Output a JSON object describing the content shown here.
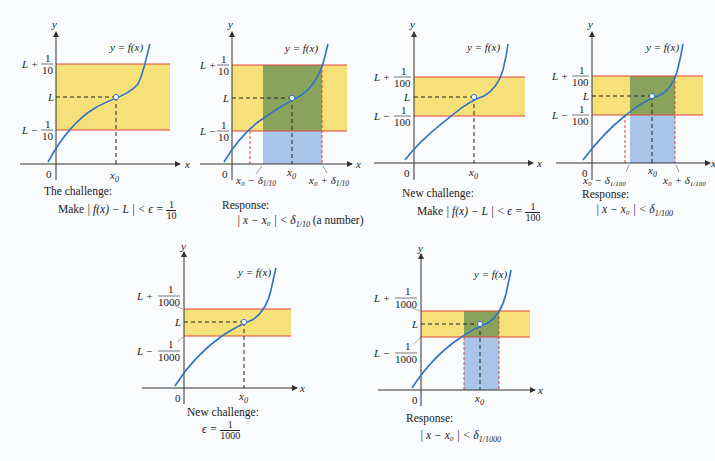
{
  "colors": {
    "band_yellow": "#f5e07a",
    "band_green": "#8aa35c",
    "strip_blue": "#a9c6ea",
    "boundary_red": "#e0443a",
    "curve_blue": "#2f73c2",
    "axis": "#333333"
  },
  "common": {
    "curve_label": "y = f(x)",
    "y_axis": "y",
    "x_axis": "x",
    "origin": "0",
    "x0": "x",
    "x0_sub": "0",
    "L": "L"
  },
  "panels": [
    {
      "id": "challenge-1-10",
      "upper": "L + 1/10",
      "upper_num": "1",
      "upper_den": "10",
      "lower_num": "1",
      "lower_den": "10",
      "caption_title": "The challenge:",
      "caption_expr_prefix": "Make",
      "caption_expr": "| f(x) − L | < ϵ = ",
      "caption_frac_num": "1",
      "caption_frac_den": "10"
    },
    {
      "id": "response-1-10",
      "upper_num": "1",
      "upper_den": "10",
      "lower_num": "1",
      "lower_den": "10",
      "left_tick": "x₀ − δ",
      "left_tick_sub": "1/10",
      "right_tick": "x₀ + δ",
      "right_tick_sub": "1/10",
      "caption_title": "Response:",
      "caption_expr": "| x − x₀ | < δ",
      "caption_sub": "1/10",
      "caption_suffix": " (a number)"
    },
    {
      "id": "challenge-1-100",
      "upper_num": "1",
      "upper_den": "100",
      "lower_num": "1",
      "lower_den": "100",
      "caption_title": "New challenge:",
      "caption_expr_prefix": "Make",
      "caption_expr": "| f(x) − L | < ϵ = ",
      "caption_frac_num": "1",
      "caption_frac_den": "100"
    },
    {
      "id": "response-1-100",
      "upper_num": "1",
      "upper_den": "100",
      "lower_num": "1",
      "lower_den": "100",
      "left_tick": "x₀ − δ",
      "left_tick_sub": "1/100",
      "right_tick": "x₀ + δ",
      "right_tick_sub": "1/100",
      "caption_title": "Response:",
      "caption_expr": "| x − x₀ | < δ",
      "caption_sub": "1/100"
    },
    {
      "id": "challenge-1-1000",
      "upper_num": "1",
      "upper_den": "1000",
      "lower_num": "1",
      "lower_den": "1000",
      "caption_title": "New challenge:",
      "caption_expr": "ϵ = ",
      "caption_frac_num": "1",
      "caption_frac_den": "1000"
    },
    {
      "id": "response-1-1000",
      "upper_num": "1",
      "upper_den": "1000",
      "lower_num": "1",
      "lower_den": "1000",
      "caption_title": "Response:",
      "caption_expr": "| x − x₀ | < δ",
      "caption_sub": "1/1000"
    }
  ]
}
